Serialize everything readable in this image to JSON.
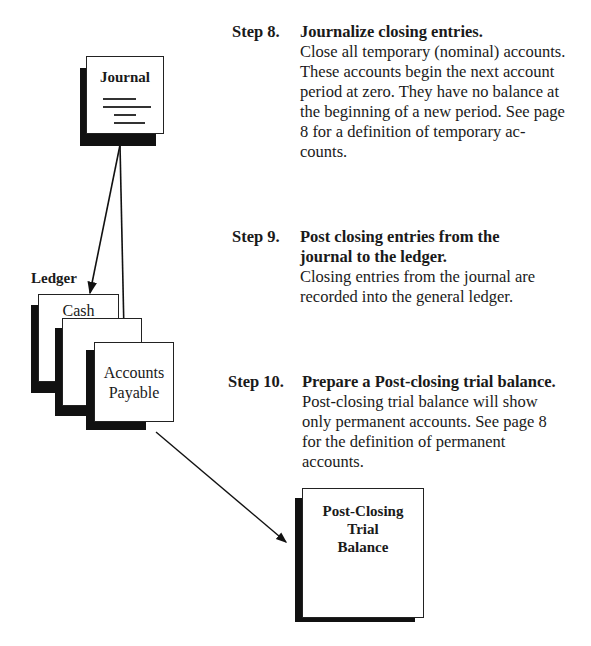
{
  "diagram": {
    "journal": {
      "title": "Journal"
    },
    "ledger": {
      "label": "Ledger",
      "cards": [
        {
          "title": "Cash"
        },
        {
          "title": ""
        },
        {
          "title_line1": "Accounts",
          "title_line2": "Payable"
        }
      ]
    },
    "post_closing": {
      "line1": "Post-Closing",
      "line2": "Trial",
      "line3": "Balance"
    }
  },
  "steps": [
    {
      "number": "Step 8.",
      "title": "Journalize closing entries.",
      "body": "Close all temporary (nominal) accounts. These accounts begin the next account period at zero. They have no balance at the beginning of a new period. See page 8 for a definition of temporary ac-counts."
    },
    {
      "number": "Step 9.",
      "title": "Post closing entries from the journal to the ledger.",
      "body": "Closing entries from the journal are recorded into the general ledger."
    },
    {
      "number": "Step 10.",
      "title": "Prepare a Post-closing trial balance.",
      "body": "Post-closing trial balance will show only permanent accounts. See page 8 for the definition of permanent accounts."
    }
  ]
}
